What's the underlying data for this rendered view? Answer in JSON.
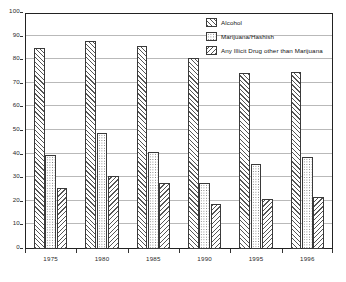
{
  "chart_data": {
    "type": "bar",
    "title": "",
    "subtitle": "",
    "xlabel": "",
    "ylabel": "",
    "ylim": [
      0,
      100
    ],
    "ytick_step": 10,
    "yticks": [
      "0",
      "10",
      "20",
      "30",
      "40",
      "50",
      "60",
      "70",
      "80",
      "90",
      "100"
    ],
    "grid": true,
    "legend_position": "top-right",
    "categories": [
      "1975",
      "1980",
      "1985",
      "1990",
      "1995",
      "1996"
    ],
    "series": [
      {
        "name": "Alcohol",
        "pattern": "diagonal-hatch-right",
        "values": [
          85,
          88,
          86,
          81,
          74.5,
          75
        ]
      },
      {
        "name": "Marijuana/Hashish",
        "pattern": "dotted",
        "values": [
          40,
          49,
          41,
          28,
          36,
          39
        ]
      },
      {
        "name": "Any Illicit Drug other than Marijuana",
        "pattern": "diagonal-hatch-left",
        "values": [
          26,
          31,
          28,
          19,
          21,
          22
        ]
      }
    ]
  },
  "colors": {
    "frame": "#222222",
    "gridline": "#b9b9b9",
    "bar_outline": "#3a3a3a",
    "hatch": "#555555",
    "dot": "#777777",
    "text": "#2a2a2a",
    "background": "#ffffff"
  }
}
